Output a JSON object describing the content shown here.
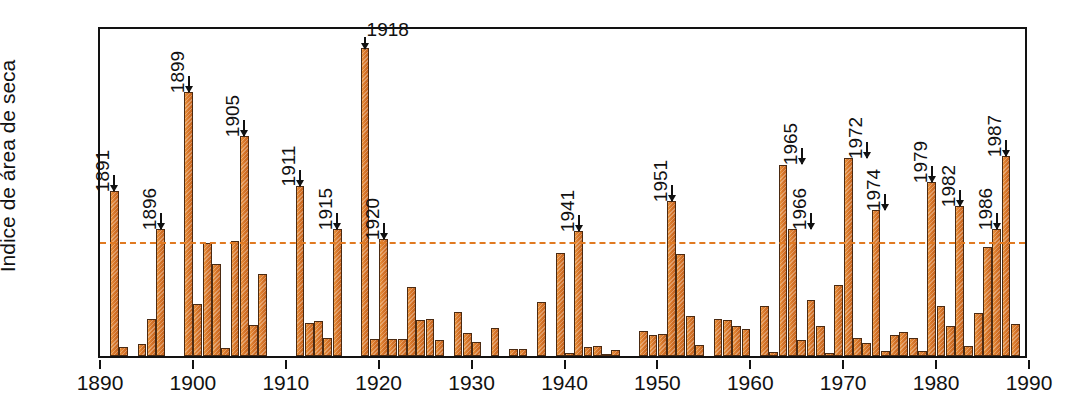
{
  "chart_data": {
    "type": "bar",
    "title": "",
    "subtitle": "",
    "xlabel": "",
    "ylabel": "Índice de área de seca",
    "xlim": [
      1890,
      1990
    ],
    "ylim": [
      0,
      70
    ],
    "yticks": [
      0,
      10,
      20,
      30,
      40,
      50,
      60,
      70
    ],
    "xticks": [
      1890,
      1900,
      1910,
      1920,
      1930,
      1940,
      1950,
      1960,
      1970,
      1980,
      1990
    ],
    "grid": false,
    "legend": false,
    "reference_line": {
      "value": 25,
      "style": "dashed",
      "color": "#e07a22"
    },
    "bar_color": "#d8762a",
    "bar_edge_color": "#4a2a12",
    "axis_color": "#121212",
    "x": [
      1891,
      1892,
      1894,
      1895,
      1896,
      1899,
      1900,
      1901,
      1902,
      1903,
      1904,
      1905,
      1906,
      1907,
      1911,
      1912,
      1913,
      1914,
      1915,
      1918,
      1919,
      1920,
      1921,
      1922,
      1923,
      1924,
      1925,
      1926,
      1928,
      1929,
      1930,
      1932,
      1934,
      1935,
      1937,
      1939,
      1940,
      1941,
      1942,
      1943,
      1944,
      1945,
      1948,
      1949,
      1950,
      1951,
      1952,
      1953,
      1954,
      1956,
      1957,
      1958,
      1959,
      1961,
      1962,
      1963,
      1964,
      1965,
      1966,
      1967,
      1968,
      1969,
      1970,
      1971,
      1972,
      1973,
      1974,
      1975,
      1976,
      1977,
      1978,
      1979,
      1980,
      1981,
      1982,
      1983,
      1984,
      1985,
      1986,
      1987,
      1988
    ],
    "values": [
      34.8,
      2.0,
      2.6,
      7.8,
      26.9,
      55.8,
      11.1,
      23.8,
      19.5,
      1.6,
      24.3,
      46.5,
      6.5,
      17.4,
      35.9,
      6.9,
      7.3,
      3.8,
      26.8,
      65.2,
      3.5,
      24.8,
      3.7,
      3.6,
      14.6,
      7.6,
      7.9,
      3.3,
      9.4,
      4.8,
      3.0,
      6.0,
      1.4,
      1.5,
      11.5,
      21.7,
      0.6,
      26.5,
      1.9,
      2.2,
      0.4,
      1.3,
      5.2,
      4.4,
      4.6,
      32.8,
      21.6,
      8.4,
      2.4,
      7.8,
      7.6,
      6.4,
      5.8,
      10.5,
      0.9,
      40.5,
      26.8,
      3.3,
      11.8,
      6.3,
      0.7,
      15.0,
      41.9,
      3.9,
      2.8,
      30.9,
      1.1,
      4.5,
      5.1,
      3.9,
      1.1,
      36.7,
      10.5,
      6.3,
      31.8,
      2.2,
      9.0,
      23.1,
      26.9,
      42.2,
      6.7
    ],
    "annotations": [
      {
        "year": 1891,
        "label": "1891",
        "value": 34.8,
        "orientation": "vertical"
      },
      {
        "year": 1896,
        "label": "1896",
        "value": 26.9,
        "orientation": "vertical"
      },
      {
        "year": 1899,
        "label": "1899",
        "value": 55.8,
        "orientation": "vertical"
      },
      {
        "year": 1905,
        "label": "1905",
        "value": 46.5,
        "orientation": "vertical"
      },
      {
        "year": 1911,
        "label": "1911",
        "value": 35.9,
        "orientation": "vertical"
      },
      {
        "year": 1915,
        "label": "1915",
        "value": 26.8,
        "orientation": "vertical"
      },
      {
        "year": 1918,
        "label": "1918",
        "value": 65.2,
        "orientation": "horizontal"
      },
      {
        "year": 1920,
        "label": "1920",
        "value": 24.8,
        "orientation": "vertical"
      },
      {
        "year": 1941,
        "label": "1941",
        "value": 26.5,
        "orientation": "vertical"
      },
      {
        "year": 1951,
        "label": "1951",
        "value": 32.8,
        "orientation": "vertical"
      },
      {
        "year": 1965,
        "label": "1965",
        "value": 40.5,
        "orientation": "vertical"
      },
      {
        "year": 1966,
        "label": "1966",
        "value": 26.8,
        "orientation": "vertical"
      },
      {
        "year": 1972,
        "label": "1972",
        "value": 41.9,
        "orientation": "vertical"
      },
      {
        "year": 1974,
        "label": "1974",
        "value": 30.9,
        "orientation": "vertical"
      },
      {
        "year": 1979,
        "label": "1979",
        "value": 36.7,
        "orientation": "vertical"
      },
      {
        "year": 1982,
        "label": "1982",
        "value": 31.8,
        "orientation": "vertical"
      },
      {
        "year": 1986,
        "label": "1986",
        "value": 26.9,
        "orientation": "vertical"
      },
      {
        "year": 1987,
        "label": "1987",
        "value": 42.2,
        "orientation": "vertical"
      }
    ]
  }
}
